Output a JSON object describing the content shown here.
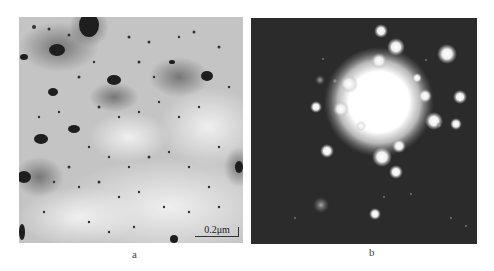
{
  "figure": {
    "panels": [
      {
        "id": "a",
        "label": "a",
        "description": "Bright-field TEM micrograph showing dark precipitate particles in a light matrix",
        "scale_bar": "0.2μm"
      },
      {
        "id": "b",
        "label": "b",
        "description": "Selected-area electron diffraction pattern with bright central spot and surrounding diffraction spots on dark background"
      }
    ]
  },
  "colors": {
    "micrograph_bg": "#c9c9c9",
    "diffraction_bg": "#2e2e2e"
  }
}
